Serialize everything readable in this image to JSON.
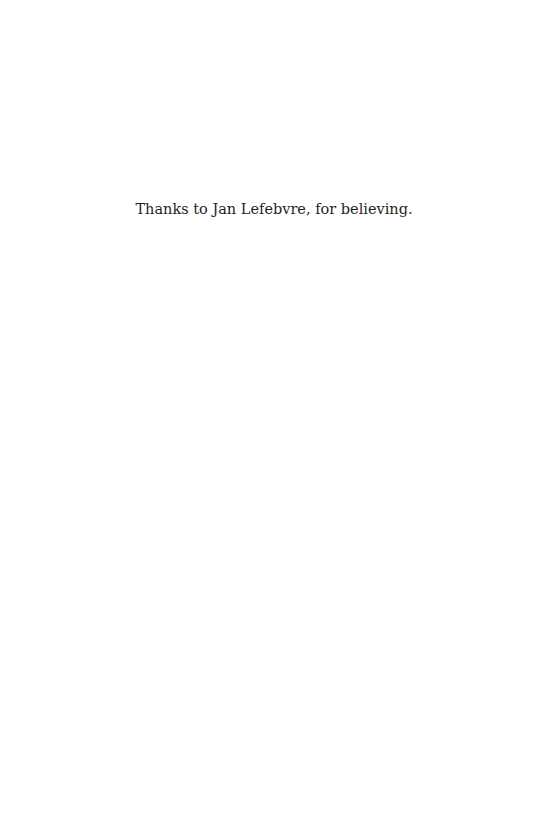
{
  "page": {
    "dedication": "Thanks to Jan Lefebvre, for believing."
  }
}
